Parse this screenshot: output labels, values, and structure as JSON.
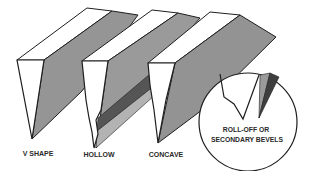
{
  "diagram": {
    "colors": {
      "line": "#1e1e1e",
      "bevel_face": "#8f8f8f",
      "bevel_face_light": "#a8a8a8",
      "hollow_band": "#5a5a5a",
      "secondary_bevel": "#3e3e3e",
      "background": "#ffffff"
    },
    "profiles": [
      {
        "id": "v-shape",
        "label": "V SHAPE"
      },
      {
        "id": "hollow",
        "label": "HOLLOW"
      },
      {
        "id": "concave",
        "label": "CONCAVE"
      }
    ],
    "detail_callout": {
      "line1": "ROLL-OFF OR",
      "line2": "SECONDARY BEVELS"
    }
  }
}
